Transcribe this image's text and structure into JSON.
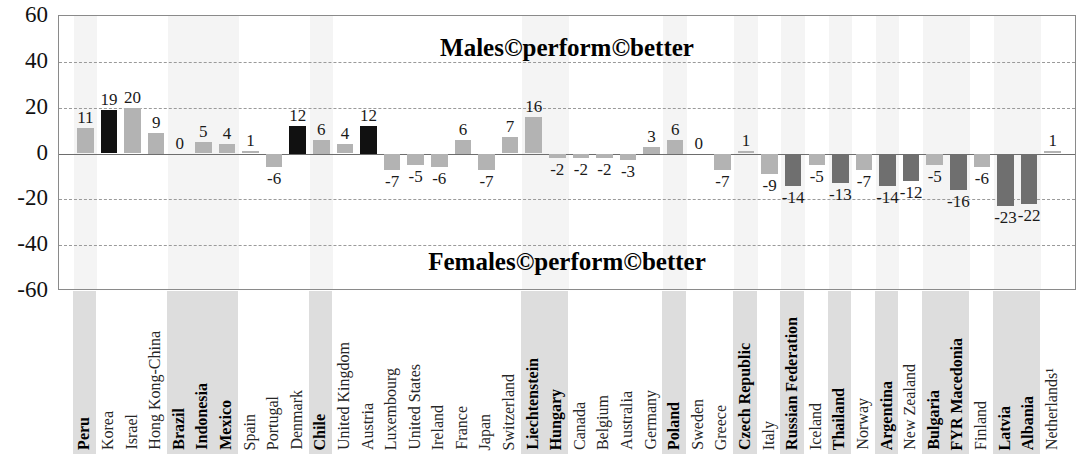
{
  "chart_data": {
    "type": "bar",
    "title": "",
    "xlabel": "",
    "ylabel": "",
    "ylim": [
      -60,
      60
    ],
    "yticks": [
      60,
      40,
      20,
      0,
      -20,
      -40,
      -60
    ],
    "grid": true,
    "legend_position": "none",
    "annotations": [
      {
        "id": "males-banner",
        "text": "Males©perform©better"
      },
      {
        "id": "females-banner",
        "text": "Females©perform©better"
      }
    ],
    "categories": [
      "Peru",
      "Korea",
      "Israel",
      "Hong Kong-China",
      "Brazil",
      "Indonesia",
      "Mexico",
      "Spain",
      "Portugal",
      "Denmark",
      "Chile",
      "United Kingdom",
      "Austria",
      "Luxembourg",
      "United States",
      "Ireland",
      "France",
      "Japan",
      "Switzerland",
      "Liechtenstein",
      "Hungary",
      "Canada",
      "Belgium",
      "Australia",
      "Germany",
      "Poland",
      "Sweden",
      "Greece",
      "Czech Republic",
      "Italy",
      "Russian Federation",
      "Iceland",
      "Thailand",
      "Norway",
      "Argentina",
      "New Zealand",
      "Bulgaria",
      "FYR Macedonia",
      "Finland",
      "Latvia",
      "Albania",
      "Netherlands¹"
    ],
    "values": [
      11,
      19,
      20,
      9,
      0,
      5,
      4,
      1,
      -6,
      12,
      6,
      4,
      12,
      -7,
      -5,
      -6,
      6,
      -7,
      7,
      16,
      -2,
      -2,
      -2,
      -3,
      3,
      6,
      0,
      -7,
      1,
      -9,
      -14,
      -5,
      -13,
      -7,
      -14,
      -12,
      -5,
      -16,
      -6,
      -23,
      -22,
      1
    ],
    "bar_styles": [
      "light",
      "black",
      "light",
      "light",
      "light",
      "light",
      "light",
      "light",
      "light",
      "black",
      "light",
      "light",
      "black",
      "light",
      "light",
      "light",
      "light",
      "light",
      "light",
      "light",
      "light",
      "light",
      "light",
      "light",
      "light",
      "light",
      "light",
      "light",
      "light",
      "light",
      "dark",
      "light",
      "dark",
      "light",
      "dark",
      "dark",
      "light",
      "dark",
      "light",
      "dark",
      "dark",
      "light"
    ],
    "highlighted_categories": [
      "Peru",
      "Brazil",
      "Indonesia",
      "Mexico",
      "Chile",
      "Liechtenstein",
      "Hungary",
      "Poland",
      "Czech Republic",
      "Russian Federation",
      "Thailand",
      "Argentina",
      "Bulgaria",
      "FYR Macedonia",
      "Latvia",
      "Albania"
    ],
    "colors": {
      "light_bar": "#b3b3b3",
      "dark_bar": "#6f6f6f",
      "black_bar": "#111111",
      "band": "#d2d2d2",
      "gridline": "#9a9a9a",
      "axis": "#6d6d6d",
      "frame": "#8a8a8a"
    }
  }
}
